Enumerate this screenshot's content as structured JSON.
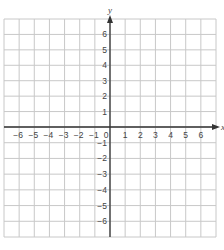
{
  "chart_data": {
    "type": "scatter",
    "title": "",
    "subtitle": "",
    "xlabel": "x",
    "ylabel": "y",
    "xlim": [
      -7,
      7
    ],
    "ylim": [
      -7,
      7
    ],
    "grid": true,
    "legend": null,
    "x_ticks": [
      -6,
      -5,
      -4,
      -3,
      -2,
      -1,
      0,
      1,
      2,
      3,
      4,
      5,
      6
    ],
    "y_ticks": [
      -6,
      -5,
      -4,
      -3,
      -2,
      -1,
      1,
      2,
      3,
      4,
      5,
      6
    ],
    "x_tick_labels": [
      "−6",
      "−5",
      "−4",
      "−3",
      "−2",
      "−1",
      "0",
      "1",
      "2",
      "3",
      "4",
      "5",
      "6"
    ],
    "y_tick_labels": [
      "−6",
      "−5",
      "−4",
      "−3",
      "−2",
      "−1",
      "1",
      "2",
      "3",
      "4",
      "5",
      "6"
    ],
    "series": []
  },
  "colors": {
    "grid": "#c8c8c8",
    "axis": "#333333",
    "label": "#444444",
    "background": "#ffffff"
  },
  "layout": {
    "grid_left": 4,
    "grid_top": 19,
    "grid_right": 216,
    "grid_bottom": 237,
    "origin_x": 110,
    "origin_y": 127
  }
}
